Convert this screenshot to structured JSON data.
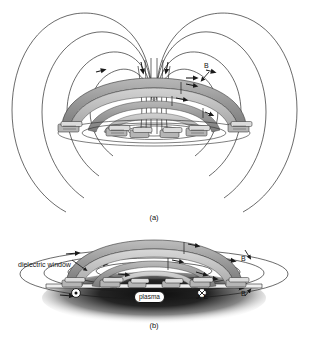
{
  "figure": {
    "background_color": "#ffffff",
    "line_color": "#1a1a1a",
    "coil_band_color": "#9a9a9a",
    "coil_band_light": "#cfcfcf",
    "coil_band_dark": "#6f6f6f",
    "plasma_color": "#141414",
    "width": 309,
    "height": 337
  },
  "panel_a": {
    "caption": "(a)",
    "field_label": "B",
    "description": "Dipole magnetic field lines encircling an arc-shaped planar/dome coil"
  },
  "panel_b": {
    "caption": "(b)",
    "window_label": "dielectric window",
    "plasma_label": "plasma",
    "current_label": "J, E",
    "field_label_right_top": "B",
    "field_label_right_bottom": "B",
    "current_out_symbol": "dot-in-circle",
    "current_in_symbol": "cross-in-circle"
  }
}
